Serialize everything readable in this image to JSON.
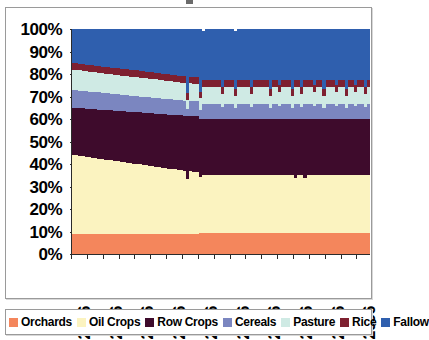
{
  "chart_data": {
    "type": "area",
    "title": "",
    "subtitle": "",
    "xlabel": "",
    "ylabel": "",
    "stacked": true,
    "normalized": true,
    "grid": false,
    "legend_position": "bottom",
    "xlim": [
      2006,
      2100
    ],
    "ylim": [
      0,
      100
    ],
    "ytick_labels": [
      "100%",
      "90%",
      "80%",
      "70%",
      "60%",
      "50%",
      "40%",
      "30%",
      "20%",
      "10%",
      "0%"
    ],
    "ytick_values": [
      100,
      90,
      80,
      70,
      60,
      50,
      40,
      30,
      20,
      10,
      0
    ],
    "xtick_labels": [
      "2006",
      "2016",
      "2026",
      "2036",
      "2046",
      "2056",
      "2066",
      "2076",
      "2086",
      "2096"
    ],
    "xtick_values": [
      2006,
      2016,
      2026,
      2036,
      2046,
      2056,
      2066,
      2076,
      2086,
      2096
    ],
    "x": [
      2006,
      2007,
      2008,
      2009,
      2010,
      2011,
      2012,
      2013,
      2014,
      2015,
      2016,
      2017,
      2018,
      2019,
      2020,
      2021,
      2022,
      2023,
      2024,
      2025,
      2026,
      2027,
      2028,
      2029,
      2030,
      2031,
      2032,
      2033,
      2034,
      2035,
      2036,
      2037,
      2038,
      2039,
      2040,
      2041,
      2042,
      2043,
      2044,
      2045,
      2046,
      2047,
      2048,
      2049,
      2050,
      2051,
      2052,
      2053,
      2054,
      2055,
      2056,
      2057,
      2058,
      2059,
      2060,
      2061,
      2062,
      2063,
      2064,
      2065,
      2066,
      2067,
      2068,
      2069,
      2070,
      2071,
      2072,
      2073,
      2074,
      2075,
      2076,
      2077,
      2078,
      2079,
      2080,
      2081,
      2082,
      2083,
      2084,
      2085,
      2086,
      2087,
      2088,
      2089,
      2090,
      2091,
      2092,
      2093,
      2094,
      2095,
      2096,
      2097,
      2098,
      2099,
      2100
    ],
    "series": [
      {
        "name": "Orchards",
        "color": "#F4865C",
        "values": [
          9.0,
          9.0,
          9.0,
          9.0,
          9.0,
          9.0,
          9.0,
          9.0,
          9.0,
          9.0,
          9.0,
          9.0,
          9.0,
          9.0,
          9.0,
          9.0,
          9.0,
          9.0,
          9.0,
          9.0,
          9.0,
          9.0,
          9.0,
          9.0,
          9.0,
          9.0,
          9.0,
          9.0,
          9.0,
          9.0,
          9.0,
          9.0,
          9.0,
          9.0,
          9.0,
          9.0,
          9.0,
          9.0,
          9.0,
          9.0,
          9.2,
          9.2,
          9.2,
          9.2,
          9.2,
          9.2,
          9.2,
          9.2,
          9.2,
          9.2,
          9.2,
          9.2,
          9.2,
          9.2,
          9.2,
          9.2,
          9.2,
          9.2,
          9.2,
          9.2,
          9.2,
          9.2,
          9.2,
          9.2,
          9.2,
          9.2,
          9.2,
          9.2,
          9.2,
          9.2,
          9.2,
          9.2,
          9.2,
          9.2,
          9.2,
          9.2,
          9.2,
          9.2,
          9.2,
          9.2,
          9.2,
          9.2,
          9.2,
          9.2,
          9.2,
          9.2,
          9.2,
          9.2,
          9.2,
          9.2,
          9.2,
          9.2,
          9.2,
          9.2,
          9.2
        ]
      },
      {
        "name": "Oil Crops",
        "color": "#FBF3C0",
        "values": [
          35.0,
          34.8,
          34.6,
          34.4,
          34.2,
          34.0,
          33.8,
          33.6,
          33.4,
          33.2,
          33.0,
          32.8,
          32.6,
          32.4,
          32.2,
          32.0,
          31.8,
          31.6,
          31.4,
          31.2,
          31.0,
          30.8,
          30.6,
          30.4,
          30.2,
          30.0,
          29.8,
          29.6,
          29.4,
          29.2,
          29.0,
          28.8,
          28.6,
          28.4,
          28.2,
          28.0,
          24.5,
          27.8,
          27.6,
          27.4,
          25.0,
          26.0,
          25.8,
          25.8,
          25.8,
          25.8,
          25.8,
          25.8,
          25.8,
          25.8,
          25.8,
          25.8,
          25.8,
          25.8,
          25.8,
          25.8,
          25.8,
          25.8,
          25.8,
          25.8,
          25.8,
          25.8,
          25.8,
          25.8,
          25.8,
          25.8,
          25.8,
          25.8,
          25.8,
          25.8,
          24.6,
          25.8,
          25.8,
          24.8,
          25.8,
          25.8,
          25.8,
          25.8,
          25.8,
          25.8,
          25.8,
          25.8,
          25.8,
          25.8,
          25.8,
          25.8,
          25.8,
          25.8,
          25.8,
          25.8,
          25.8,
          25.8,
          25.8,
          25.8,
          25.8
        ]
      },
      {
        "name": "Row Crops",
        "color": "#3E0B2C",
        "values": [
          21.0,
          21.1,
          21.2,
          21.3,
          21.4,
          21.5,
          21.6,
          21.7,
          21.8,
          21.9,
          22.0,
          22.1,
          22.2,
          22.3,
          22.4,
          22.5,
          22.6,
          22.7,
          22.8,
          22.9,
          23.0,
          23.1,
          23.2,
          23.3,
          23.4,
          23.5,
          23.6,
          23.7,
          23.8,
          23.9,
          24.0,
          24.1,
          24.2,
          24.3,
          24.4,
          24.5,
          28.0,
          24.6,
          24.7,
          24.8,
          26.0,
          25.0,
          25.2,
          25.2,
          25.2,
          25.2,
          25.2,
          25.2,
          25.2,
          25.2,
          25.2,
          25.2,
          25.2,
          25.2,
          25.2,
          25.2,
          25.2,
          25.2,
          25.2,
          25.2,
          25.2,
          25.2,
          25.2,
          25.2,
          25.2,
          25.2,
          25.2,
          25.2,
          25.2,
          25.2,
          26.4,
          25.2,
          25.2,
          26.2,
          25.2,
          25.2,
          25.2,
          25.2,
          25.2,
          25.2,
          25.2,
          25.2,
          25.2,
          25.2,
          25.2,
          25.2,
          25.2,
          25.2,
          25.2,
          25.2,
          25.2,
          25.2,
          25.2,
          25.2,
          25.2
        ]
      },
      {
        "name": "Cereals",
        "color": "#7B86C0",
        "values": [
          7.8,
          7.8,
          7.8,
          7.7,
          7.7,
          7.7,
          7.6,
          7.6,
          7.6,
          7.5,
          7.5,
          7.5,
          7.4,
          7.4,
          7.4,
          7.3,
          7.3,
          7.3,
          7.2,
          7.2,
          7.2,
          7.1,
          7.1,
          7.1,
          7.0,
          7.0,
          7.0,
          6.9,
          6.9,
          6.9,
          6.8,
          6.8,
          6.8,
          6.7,
          6.7,
          6.7,
          3.0,
          6.6,
          6.6,
          6.6,
          4.0,
          6.5,
          6.5,
          6.5,
          6.5,
          6.5,
          6.5,
          5.0,
          6.5,
          6.5,
          6.5,
          4.5,
          6.5,
          6.5,
          6.5,
          6.5,
          5.0,
          6.5,
          6.5,
          6.5,
          6.5,
          6.5,
          4.5,
          6.5,
          6.5,
          5.5,
          6.5,
          6.5,
          6.5,
          4.5,
          6.5,
          6.5,
          5.0,
          6.5,
          6.5,
          6.5,
          5.5,
          6.5,
          6.5,
          4.5,
          6.5,
          6.5,
          6.5,
          5.5,
          6.5,
          6.5,
          4.5,
          6.5,
          6.5,
          5.5,
          6.5,
          6.5,
          5.0,
          6.5,
          6.5
        ]
      },
      {
        "name": "Pasture",
        "color": "#CFEAE4",
        "values": [
          9.0,
          9.0,
          9.0,
          8.9,
          8.9,
          8.9,
          8.8,
          8.8,
          8.8,
          8.7,
          8.7,
          8.7,
          8.6,
          8.6,
          8.6,
          8.5,
          8.5,
          8.5,
          8.4,
          8.4,
          8.4,
          8.3,
          8.3,
          8.3,
          8.2,
          8.2,
          8.2,
          8.1,
          8.1,
          8.1,
          8.0,
          8.0,
          8.0,
          7.9,
          7.9,
          7.9,
          4.0,
          7.8,
          7.8,
          7.8,
          5.0,
          7.7,
          7.7,
          7.7,
          7.7,
          7.7,
          7.7,
          6.0,
          7.7,
          7.7,
          7.7,
          5.5,
          7.7,
          7.7,
          7.7,
          7.7,
          6.0,
          7.7,
          7.7,
          7.7,
          7.7,
          7.7,
          5.5,
          7.7,
          7.7,
          6.5,
          7.7,
          7.7,
          7.7,
          5.5,
          7.7,
          7.7,
          6.0,
          7.7,
          7.7,
          7.7,
          6.5,
          7.7,
          7.7,
          5.5,
          7.7,
          7.7,
          7.7,
          6.5,
          7.7,
          7.7,
          5.5,
          7.7,
          7.7,
          6.5,
          7.7,
          7.7,
          6.0,
          7.7,
          7.7
        ]
      },
      {
        "name": "Rice",
        "color": "#7E2030",
        "values": [
          3.0,
          3.0,
          3.0,
          3.0,
          3.0,
          3.0,
          3.0,
          3.0,
          3.0,
          3.0,
          3.0,
          3.0,
          3.0,
          3.0,
          3.0,
          3.0,
          3.0,
          3.0,
          3.0,
          3.0,
          3.0,
          3.0,
          3.0,
          3.0,
          3.0,
          3.0,
          3.0,
          3.0,
          3.0,
          3.0,
          3.0,
          3.0,
          3.0,
          3.0,
          3.0,
          3.0,
          3.0,
          3.0,
          3.0,
          3.0,
          3.0,
          3.0,
          3.0,
          3.0,
          3.0,
          3.0,
          3.0,
          3.0,
          3.0,
          3.0,
          3.0,
          3.0,
          3.0,
          3.0,
          3.0,
          3.0,
          3.0,
          3.0,
          3.0,
          3.0,
          3.0,
          3.0,
          3.0,
          3.0,
          3.0,
          3.0,
          3.0,
          3.0,
          3.0,
          3.0,
          3.0,
          3.0,
          3.0,
          3.0,
          3.0,
          3.0,
          3.0,
          3.0,
          3.0,
          3.0,
          3.0,
          3.0,
          3.0,
          3.0,
          3.0,
          3.0,
          3.0,
          3.0,
          3.0,
          3.0,
          3.0,
          3.0,
          3.0,
          3.0,
          3.0
        ]
      },
      {
        "name": "Fallow",
        "color": "#2F5FAE",
        "values": [
          15.2,
          15.3,
          15.4,
          15.7,
          15.8,
          15.9,
          16.2,
          16.3,
          16.4,
          16.7,
          16.8,
          16.9,
          17.2,
          17.3,
          17.4,
          17.7,
          17.8,
          17.9,
          18.2,
          18.3,
          18.4,
          18.7,
          18.8,
          18.9,
          19.2,
          19.3,
          19.4,
          19.7,
          19.8,
          19.9,
          20.2,
          20.3,
          20.4,
          20.7,
          20.8,
          20.9,
          28.5,
          21.2,
          21.3,
          21.4,
          27.8,
          21.6,
          22.6,
          22.6,
          22.6,
          22.6,
          22.6,
          25.6,
          22.6,
          22.6,
          22.6,
          26.1,
          22.6,
          22.6,
          22.6,
          22.6,
          25.6,
          22.6,
          22.6,
          22.6,
          22.6,
          22.6,
          26.6,
          22.6,
          22.6,
          24.6,
          22.6,
          22.6,
          22.6,
          26.6,
          22.6,
          22.6,
          25.6,
          22.6,
          22.6,
          22.6,
          24.6,
          22.6,
          22.6,
          26.6,
          22.6,
          22.6,
          22.6,
          24.6,
          22.6,
          22.6,
          26.6,
          22.6,
          22.6,
          24.6,
          22.6,
          22.6,
          25.6,
          22.6,
          22.6
        ]
      }
    ]
  },
  "legend": {
    "items": [
      {
        "label": "Orchards",
        "color": "#F4865C"
      },
      {
        "label": "Oil Crops",
        "color": "#FBF3C0"
      },
      {
        "label": "Row Crops",
        "color": "#3E0B2C"
      },
      {
        "label": "Cereals",
        "color": "#7B86C0"
      },
      {
        "label": "Pasture",
        "color": "#CFEAE4"
      },
      {
        "label": "Rice",
        "color": "#7E2030"
      },
      {
        "label": "Fallow",
        "color": "#2F5FAE"
      }
    ]
  }
}
